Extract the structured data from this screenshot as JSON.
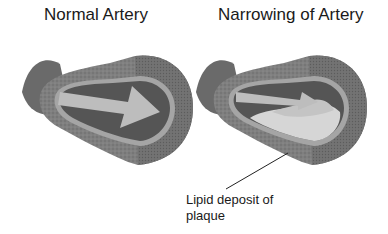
{
  "panels": [
    {
      "title": "Normal Artery"
    },
    {
      "title": "Narrowing of Artery"
    }
  ],
  "annotations": {
    "plaque_label_line1": "Lipid deposit of",
    "plaque_label_line2": "plaque"
  },
  "colors": {
    "outer_wall": "#8a8a8a",
    "wall_dark": "#6b6b6b",
    "inner_lining": "#a8a8a8",
    "lumen": "#555555",
    "arrow": "#b9b9b9",
    "plaque": "#d6d6d6",
    "background": "#ffffff"
  }
}
